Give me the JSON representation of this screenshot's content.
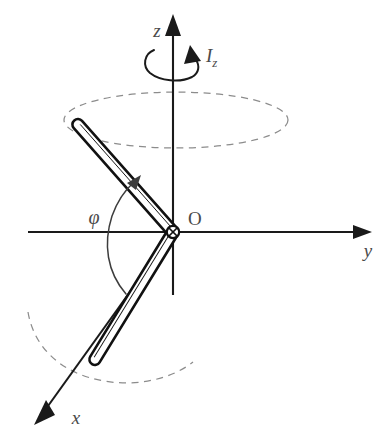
{
  "figure": {
    "background_color": "#ffffff",
    "ink_color": "#111111",
    "label_color": "#4a4a4a",
    "dashed_color": "#8c8c8c"
  },
  "axes": {
    "z": {
      "label": "z",
      "direction": "up",
      "arrow": true
    },
    "y": {
      "label": "y",
      "direction": "right",
      "arrow": true
    },
    "x": {
      "label": "x",
      "direction": "down-left",
      "arrow": true
    }
  },
  "origin": {
    "label": "O",
    "marker": "pivot-circle-cross"
  },
  "annotations": {
    "moment_of_inertia": {
      "label": "I",
      "subscript": "z",
      "symbol": "spin-arrow-about-z"
    },
    "angle": {
      "label": "φ",
      "description": "angle swept from lower rod segment to upper rod segment"
    }
  },
  "rods": [
    {
      "name": "upper-rod",
      "description": "rod segment extending up and to the left from the pivot"
    },
    {
      "name": "lower-rod",
      "description": "rod segment extending down and to the left from the pivot"
    }
  ],
  "orbits": [
    {
      "name": "upper-orbit",
      "style": "dashed-ellipse-full",
      "description": "circular path traced by the upper rod tip"
    },
    {
      "name": "lower-orbit",
      "style": "dashed-ellipse-arc",
      "description": "partial circular path traced by the lower rod tip"
    }
  ]
}
